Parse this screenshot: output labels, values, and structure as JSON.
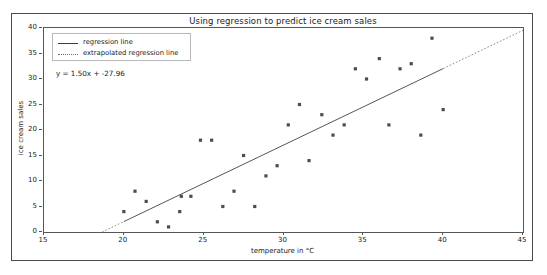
{
  "figure": {
    "title": "Using regression to predict ice cream sales"
  },
  "legend": {
    "items": [
      {
        "label": "regression line",
        "style": "solid",
        "color": "#3d3d3d"
      },
      {
        "label": "extrapolated regression line",
        "style": "dotted",
        "color": "#6e6e6e"
      }
    ]
  },
  "annotation": {
    "equation": "y = 1.50x + -27.96"
  },
  "chart_data": {
    "type": "scatter",
    "title": "Using regression to predict ice cream sales",
    "xlabel": "temperature in °C",
    "ylabel": "ice cream sales",
    "xlim": [
      15,
      45
    ],
    "ylim": [
      0,
      40
    ],
    "xticks": [
      15,
      20,
      25,
      30,
      35,
      40,
      45
    ],
    "yticks": [
      0,
      5,
      10,
      15,
      20,
      25,
      30,
      35,
      40
    ],
    "grid": false,
    "legend_position": "upper left",
    "series": [
      {
        "name": "observations",
        "type": "scatter",
        "marker": "square",
        "color": "#4d4d4d",
        "points": [
          [
            20.0,
            4
          ],
          [
            20.7,
            8
          ],
          [
            21.4,
            6
          ],
          [
            22.1,
            2
          ],
          [
            22.8,
            1
          ],
          [
            23.5,
            4
          ],
          [
            23.6,
            7
          ],
          [
            24.2,
            7
          ],
          [
            24.8,
            18
          ],
          [
            25.5,
            18
          ],
          [
            26.2,
            5
          ],
          [
            26.9,
            8
          ],
          [
            27.5,
            15
          ],
          [
            28.2,
            5
          ],
          [
            28.9,
            11
          ],
          [
            29.6,
            13
          ],
          [
            30.3,
            21
          ],
          [
            31.0,
            25
          ],
          [
            31.6,
            14
          ],
          [
            32.4,
            23
          ],
          [
            33.1,
            19
          ],
          [
            33.8,
            21
          ],
          [
            34.5,
            32
          ],
          [
            35.2,
            30
          ],
          [
            36.0,
            34
          ],
          [
            36.6,
            21
          ],
          [
            37.3,
            32
          ],
          [
            38.0,
            33
          ],
          [
            38.6,
            19
          ],
          [
            39.3,
            38
          ],
          [
            40.0,
            24
          ]
        ]
      },
      {
        "name": "regression line",
        "type": "line",
        "style": "solid",
        "color": "#555555",
        "slope": 1.5,
        "intercept": -27.96,
        "x_range": [
          20.0,
          40.0
        ]
      },
      {
        "name": "extrapolated regression line",
        "type": "line",
        "style": "dotted",
        "color": "#8a8a8a",
        "slope": 1.5,
        "intercept": -27.96,
        "x_range_left": [
          18.64,
          20.0
        ],
        "x_range_right": [
          40.0,
          45.0
        ]
      }
    ]
  }
}
